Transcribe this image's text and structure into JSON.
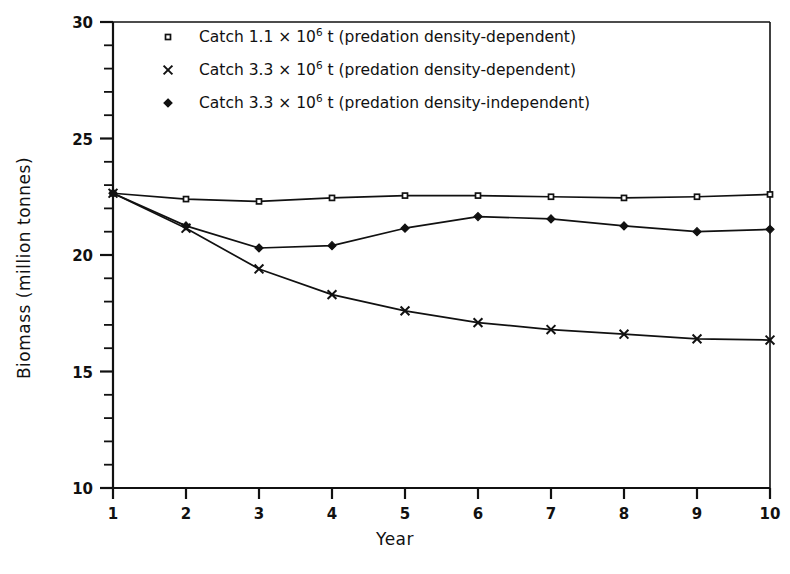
{
  "chart_data": {
    "type": "line",
    "title": "",
    "xlabel": "Year",
    "ylabel": "Biomass (million tonnes)",
    "xlim": [
      1,
      10
    ],
    "ylim": [
      10,
      30
    ],
    "x_ticks": [
      1,
      2,
      3,
      4,
      5,
      6,
      7,
      8,
      9,
      10
    ],
    "x_tick_labels": [
      "1",
      "2",
      "3",
      "4",
      "5",
      "6",
      "7",
      "8",
      "9",
      "10"
    ],
    "y_ticks": [
      10,
      15,
      20,
      25,
      30
    ],
    "y_tick_labels": [
      "10",
      "15",
      "20",
      "25",
      "30"
    ],
    "y_minor_step": 1,
    "grid": false,
    "legend_position": "upper-left-inside",
    "x": [
      1,
      2,
      3,
      4,
      5,
      6,
      7,
      8,
      9,
      10
    ],
    "series": [
      {
        "name": "Catch 1.1 × 10⁶ t (predation density-dependent)",
        "marker": "open-square",
        "values": [
          22.65,
          22.4,
          22.3,
          22.45,
          22.55,
          22.55,
          22.5,
          22.45,
          22.5,
          22.6
        ]
      },
      {
        "name": "Catch 3.3 × 10⁶ t (predation density-dependent)",
        "marker": "plus-cross",
        "values": [
          22.65,
          21.15,
          19.4,
          18.3,
          17.6,
          17.1,
          16.8,
          16.6,
          16.4,
          16.35
        ]
      },
      {
        "name": "Catch 3.3 × 10⁶ t (predation density-independent)",
        "marker": "filled-diamond",
        "values": [
          22.65,
          21.25,
          20.3,
          20.4,
          21.15,
          21.65,
          21.55,
          21.25,
          21.0,
          21.1
        ]
      }
    ]
  },
  "legend": {
    "entries": [
      {
        "marker": "open-square",
        "prefix": "Catch 1.1 × 10",
        "exponent": "6",
        "suffix": " t (predation density-dependent)"
      },
      {
        "marker": "plus-cross",
        "prefix": "Catch 3.3 × 10",
        "exponent": "6",
        "suffix": " t (predation density-dependent)"
      },
      {
        "marker": "filled-diamond",
        "prefix": "Catch 3.3 × 10",
        "exponent": "6",
        "suffix": " t (predation density-independent)"
      }
    ]
  },
  "axes": {
    "x_title": "Year",
    "y_title": "Biomass (million tonnes)"
  },
  "colors": {
    "ink": "#111111",
    "background": "#ffffff"
  }
}
